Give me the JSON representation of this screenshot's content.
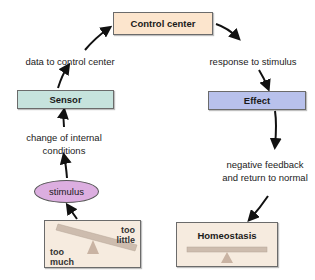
{
  "diagram": {
    "nodes": {
      "control_center": {
        "label": "Control center",
        "color": "#fce5cd"
      },
      "sensor": {
        "label": "Sensor",
        "color": "#c6e3dd"
      },
      "effect": {
        "label": "Effect",
        "color": "#b8c1ec"
      },
      "stimulus": {
        "label": "stimulus",
        "color": "#dcaee0"
      },
      "imbalance": {
        "left_label_1": "too",
        "left_label_2": "much",
        "right_label_1": "too",
        "right_label_2": "little",
        "color": "#f6ebdf"
      },
      "homeostasis": {
        "label": "Homeostasis",
        "color": "#f6ebdf"
      }
    },
    "edges": {
      "sensor_to_control": "data to control center",
      "control_to_effect": "response to stimulus",
      "stimulus_to_sensor_1": "change of internal",
      "stimulus_to_sensor_2": "conditions",
      "effect_to_homeostasis_1": "negative feedback",
      "effect_to_homeostasis_2": "and return to normal"
    },
    "colors": {
      "arrow": "#111111",
      "beam": "#cdbcae",
      "fulcrum": "#c9b3a3"
    }
  }
}
